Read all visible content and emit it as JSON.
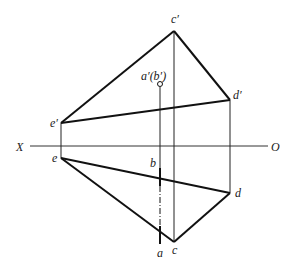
{
  "diagram": {
    "type": "orthographic-projection",
    "axis": {
      "start_label": "X",
      "end_label": "O"
    },
    "labels": {
      "c_prime": "c′",
      "d_prime": "d′",
      "e_prime": "e′",
      "ab_prime": "a′(b′)",
      "e": "e",
      "b": "b",
      "d": "d",
      "a": "a",
      "c": "c"
    },
    "points": {
      "c_prime": [
        174,
        31
      ],
      "d_prime": [
        230,
        100
      ],
      "e_prime": [
        61,
        123
      ],
      "ab_prime": [
        160,
        84
      ],
      "e": [
        61,
        158
      ],
      "d": [
        230,
        193
      ],
      "c": [
        174,
        242
      ],
      "b": [
        160,
        168
      ],
      "a": [
        160,
        242
      ]
    },
    "colors": {
      "line": "#111111",
      "axis": "#333333"
    }
  }
}
